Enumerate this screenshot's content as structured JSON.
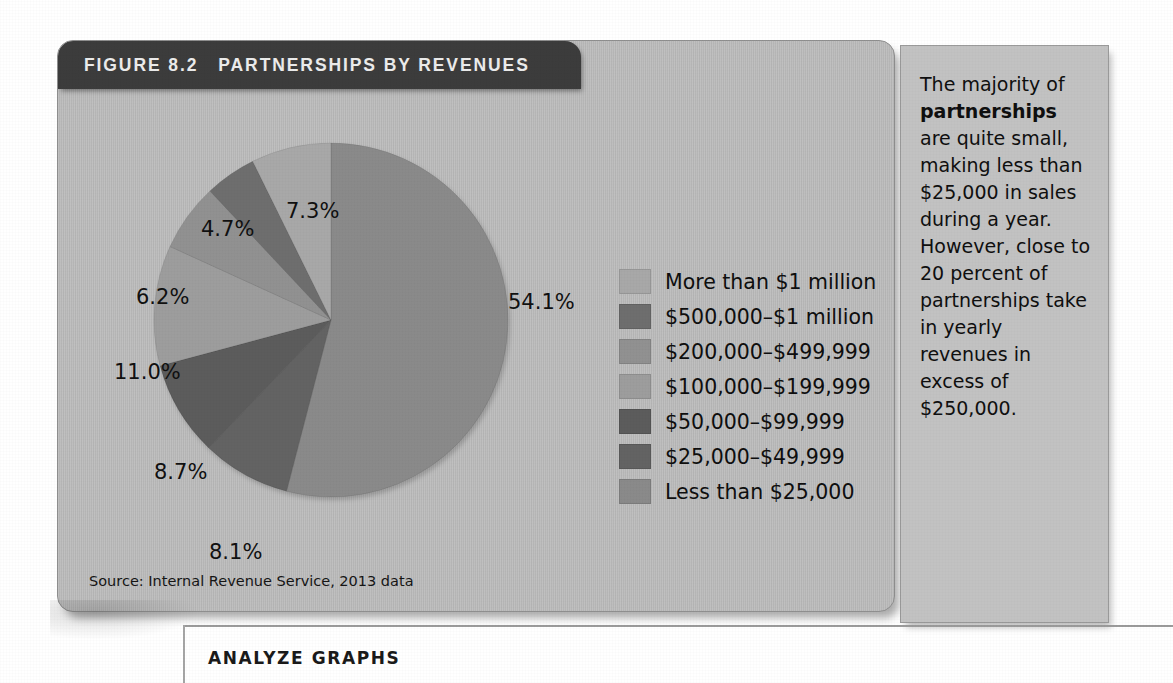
{
  "figure": {
    "number_label": "FIGURE 8.2",
    "title": "PARTNERSHIPS BY REVENUES",
    "source": "Source: Internal Revenue Service, 2013 data"
  },
  "ghost_text": "",
  "side_note": {
    "line1": "The majority of ",
    "bold": "partnerships",
    "line2": " are quite small, making less than $25,000 in sales during a year. However, close to 20 percent of partnerships take in yearly revenues in excess of $250,000."
  },
  "bottom": {
    "heading": "ANALYZE GRAPHS"
  },
  "chart_data": {
    "type": "pie",
    "title": "PARTNERSHIPS BY REVENUES",
    "source": "Source: Internal Revenue Service, 2013 data",
    "unit": "percent",
    "total": 100.1,
    "legend_position": "right",
    "categories": [
      "More than $1 million",
      "$500,000–$1 million",
      "$200,000–$499,999",
      "$100,000–$199,999",
      "$50,000–$99,999",
      "$25,000–$49,999",
      "Less than $25,000"
    ],
    "values": [
      7.3,
      4.7,
      6.2,
      11.0,
      8.7,
      8.1,
      54.1
    ],
    "colors": [
      "#a8a8a8",
      "#6e6e6e",
      "#919191",
      "#9d9d9d",
      "#5c5c5c",
      "#636363",
      "#8a8a8a"
    ],
    "labels": [
      "7.3%",
      "4.7%",
      "6.2%",
      "11.0%",
      "8.7%",
      "8.1%",
      "54.1%"
    ],
    "slices": [
      {
        "label": "Less than $25,000",
        "value": 54.1,
        "display": "54.1%",
        "color": "#8a8a8a"
      },
      {
        "label": "$25,000–$49,999",
        "value": 8.1,
        "display": "8.1%",
        "color": "#636363"
      },
      {
        "label": "$50,000–$99,999",
        "value": 8.7,
        "display": "8.7%",
        "color": "#5c5c5c"
      },
      {
        "label": "$100,000–$199,999",
        "value": 11.0,
        "display": "11.0%",
        "color": "#9d9d9d"
      },
      {
        "label": "$200,000–$499,999",
        "value": 6.2,
        "display": "6.2%",
        "color": "#919191"
      },
      {
        "label": "$500,000–$1 million",
        "value": 4.7,
        "display": "4.7%",
        "color": "#6e6e6e"
      },
      {
        "label": "More than $1 million",
        "value": 7.3,
        "display": "7.3%",
        "color": "#a8a8a8"
      }
    ]
  },
  "legend": [
    {
      "label": "More than $1 million",
      "color": "#a8a8a8"
    },
    {
      "label": "$500,000–$1 million",
      "color": "#6e6e6e"
    },
    {
      "label": "$200,000–$499,999",
      "color": "#919191"
    },
    {
      "label": "$100,000–$199,999",
      "color": "#9d9d9d"
    },
    {
      "label": "$50,000–$99,999",
      "color": "#5c5c5c"
    },
    {
      "label": "$25,000–$49,999",
      "color": "#636363"
    },
    {
      "label": "Less than $25,000",
      "color": "#8a8a8a"
    }
  ],
  "pct_labels": [
    {
      "text": "7.3%",
      "x": 228,
      "y": 110
    },
    {
      "text": "4.7%",
      "x": 143,
      "y": 128
    },
    {
      "text": "6.2%",
      "x": 78,
      "y": 196
    },
    {
      "text": "11.0%",
      "x": 56,
      "y": 271
    },
    {
      "text": "8.7%",
      "x": 96,
      "y": 371
    },
    {
      "text": "8.1%",
      "x": 151,
      "y": 451
    },
    {
      "text": "54.1%",
      "x": 450,
      "y": 201
    }
  ]
}
